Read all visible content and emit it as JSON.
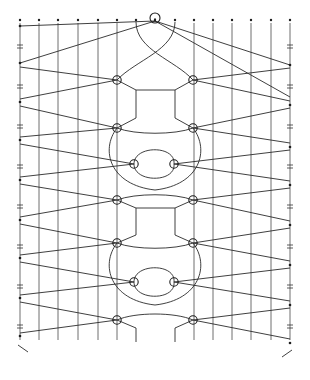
{
  "diagram": {
    "type": "bobbin-lace-pricking",
    "columns_x": [
      20,
      39,
      58,
      78,
      98,
      117,
      136,
      155,
      175,
      194,
      213,
      232,
      251,
      271,
      290
    ],
    "top_y": 20,
    "bottom_y": 340,
    "left_pins_y": [
      26,
      63,
      102,
      140,
      180,
      220,
      258,
      298,
      336
    ],
    "right_pins_y": [
      65,
      105,
      147,
      185,
      225,
      265,
      305,
      343
    ],
    "center_pin": {
      "x": 155,
      "y": 18
    },
    "nodes": [
      {
        "x": 117,
        "y": 80
      },
      {
        "x": 193,
        "y": 80
      },
      {
        "x": 117,
        "y": 128
      },
      {
        "x": 193,
        "y": 128
      },
      {
        "x": 134,
        "y": 164
      },
      {
        "x": 174,
        "y": 164
      },
      {
        "x": 117,
        "y": 200
      },
      {
        "x": 193,
        "y": 200
      },
      {
        "x": 117,
        "y": 243
      },
      {
        "x": 193,
        "y": 243
      },
      {
        "x": 134,
        "y": 282
      },
      {
        "x": 174,
        "y": 282
      },
      {
        "x": 117,
        "y": 320
      },
      {
        "x": 193,
        "y": 320
      }
    ],
    "colors": {
      "line": "#2a2a2a",
      "background": "#ffffff"
    }
  }
}
